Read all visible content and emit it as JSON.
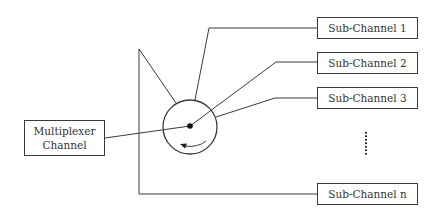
{
  "diagram": {
    "type": "multiplexer-channel-diagram",
    "source": {
      "label_line1": "Multiplexer",
      "label_line2": "Channel"
    },
    "switch": {
      "shape": "rotary-switch-circle",
      "rotation_arrow": "counter-clockwise-arrow"
    },
    "sub_channels": [
      {
        "label": "Sub-Channel 1"
      },
      {
        "label": "Sub-Channel 2"
      },
      {
        "label": "Sub-Channel 3"
      },
      {
        "label": "Sub-Channel n"
      }
    ],
    "ellipsis": "vertical-dots",
    "colors": {
      "line": "#3a3a3a",
      "text": "#333333",
      "background": "#ffffff"
    }
  }
}
